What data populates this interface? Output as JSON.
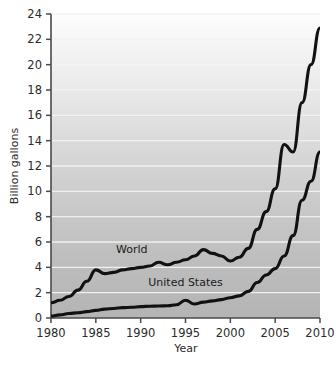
{
  "chart_data": {
    "type": "line",
    "title": "",
    "xlabel": "Year",
    "ylabel": "Billion gallons",
    "xlim": [
      1980,
      2010
    ],
    "ylim": [
      0,
      24
    ],
    "xticks": [
      "1980",
      "1985",
      "1990",
      "1995",
      "2000",
      "2005",
      "2010"
    ],
    "xtick_values": [
      1980,
      1985,
      1990,
      1995,
      2000,
      2005,
      2010
    ],
    "yticks": [
      "0",
      "2",
      "4",
      "6",
      "8",
      "10",
      "12",
      "14",
      "16",
      "18",
      "20",
      "22",
      "24"
    ],
    "ytick_values": [
      0,
      2,
      4,
      6,
      8,
      10,
      12,
      14,
      16,
      18,
      20,
      22,
      24
    ],
    "grid": "horizontal",
    "legend_position": "inline-annotation",
    "x": [
      1980,
      1981,
      1982,
      1983,
      1984,
      1985,
      1986,
      1987,
      1988,
      1989,
      1990,
      1991,
      1992,
      1993,
      1994,
      1995,
      1996,
      1997,
      1998,
      1999,
      2000,
      2001,
      2002,
      2003,
      2004,
      2005,
      2006,
      2007,
      2008,
      2009,
      2010
    ],
    "series": [
      {
        "name": "World",
        "values": [
          1.2,
          1.4,
          1.7,
          2.2,
          2.9,
          3.8,
          3.5,
          3.6,
          3.8,
          3.9,
          4.0,
          4.1,
          4.4,
          4.2,
          4.4,
          4.6,
          4.9,
          5.4,
          5.1,
          4.9,
          4.5,
          4.8,
          5.5,
          7.0,
          8.4,
          10.2,
          13.7,
          13.1,
          17.0,
          20.0,
          22.9
        ],
        "color": "#111111",
        "annotation": "World",
        "annotation_x": 1989,
        "annotation_y": 5.1
      },
      {
        "name": "United States",
        "values": [
          0.15,
          0.25,
          0.35,
          0.42,
          0.5,
          0.6,
          0.7,
          0.75,
          0.82,
          0.85,
          0.9,
          0.93,
          0.95,
          0.97,
          1.05,
          1.4,
          1.1,
          1.25,
          1.35,
          1.45,
          1.6,
          1.75,
          2.1,
          2.8,
          3.4,
          3.9,
          4.9,
          6.5,
          9.3,
          10.8,
          13.1
        ],
        "color": "#111111",
        "annotation": "United States",
        "annotation_x": 1995,
        "annotation_y": 2.5
      }
    ]
  },
  "axes": {
    "y_axis_title": "Billion gallons",
    "x_axis_title": "Year"
  },
  "colors": {
    "line": "#111111",
    "axis": "#4a4a4a",
    "gridline": "#f2f2f2",
    "plot_bg_top": "#fdfdfd",
    "plot_bg_bottom": "#b6b6b6",
    "tick_label": "#2b2b2b",
    "page_bg": "#ffffff"
  }
}
